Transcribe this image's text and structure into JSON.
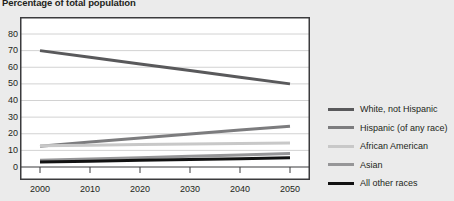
{
  "chart_data": {
    "type": "line",
    "title": "Percentage of total population",
    "xlabel": "",
    "ylabel": "",
    "xlim": [
      2000,
      2050
    ],
    "ylim": [
      0,
      80
    ],
    "grid": true,
    "legend_position": "right",
    "x": [
      2000,
      2010,
      2020,
      2030,
      2040,
      2050
    ],
    "xticks": [
      "2000",
      "2010",
      "2020",
      "2030",
      "2040",
      "2050"
    ],
    "yticks": [
      "0",
      "10",
      "20",
      "30",
      "40",
      "50",
      "60",
      "70",
      "80"
    ],
    "series": [
      {
        "name": "White, not Hispanic",
        "color": "#59595b",
        "width": 3.0,
        "values": [
          70,
          66,
          62,
          58,
          54,
          50
        ]
      },
      {
        "name": "Hispanic (of any race)",
        "color": "#7c7c7e",
        "width": 3.0,
        "values": [
          12.5,
          15,
          17.4,
          19.8,
          22.2,
          24.5
        ]
      },
      {
        "name": "African American",
        "color": "#c8c8c8",
        "width": 3.0,
        "values": [
          12.8,
          13.1,
          13.5,
          13.9,
          14.2,
          14.5
        ]
      },
      {
        "name": "Asian",
        "color": "#969698",
        "width": 3.0,
        "values": [
          4.0,
          4.8,
          5.6,
          6.4,
          7.2,
          8.1
        ]
      },
      {
        "name": "All other races",
        "color": "#111111",
        "width": 3.0,
        "values": [
          3.0,
          3.5,
          4.0,
          4.5,
          5.0,
          5.5
        ]
      }
    ]
  },
  "legend": {
    "items": [
      {
        "label": "White, not Hispanic",
        "color": "#59595b"
      },
      {
        "label": "Hispanic (of any race)",
        "color": "#7c7c7e"
      },
      {
        "label": "African American",
        "color": "#c8c8c8"
      },
      {
        "label": "Asian",
        "color": "#969698"
      },
      {
        "label": "All other races",
        "color": "#111111"
      }
    ]
  },
  "style": {
    "background": "#ebebeb",
    "plot_background": "#ffffff",
    "grid_color": "#d2d2d2",
    "axis_color": "#3b3b3d",
    "text_color": "#231f20"
  }
}
